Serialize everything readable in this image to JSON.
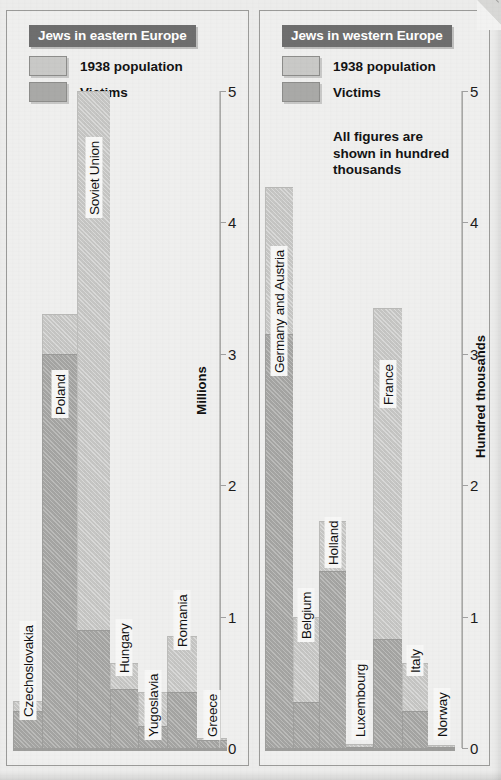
{
  "figure": {
    "note": "All figures are\nshown in hundred\nthousands"
  },
  "panels": {
    "east": {
      "title": "Jews in eastern Europe",
      "axis_title": "Millions",
      "legend": [
        {
          "key": "population",
          "label": "1938 population",
          "color": "#c9c9c7"
        },
        {
          "key": "victims",
          "label": "Victims",
          "color": "#a9a9a7"
        }
      ],
      "ticks": [
        "0",
        "1",
        "2",
        "3",
        "4",
        "5"
      ]
    },
    "west": {
      "title": "Jews in western Europe",
      "axis_title": "Hundred thousands",
      "legend": [
        {
          "key": "population",
          "label": "1938 population",
          "color": "#c9c9c7"
        },
        {
          "key": "victims",
          "label": "Victims",
          "color": "#a9a9a7"
        }
      ],
      "ticks": [
        "0",
        "1",
        "2",
        "3",
        "4",
        "5"
      ]
    }
  },
  "chart_data": [
    {
      "id": "eastern-europe",
      "type": "bar",
      "title": "Jews in eastern Europe",
      "xlabel": "",
      "ylabel": "Millions",
      "ylim": [
        0,
        5
      ],
      "yticks": [
        0,
        1,
        2,
        3,
        4,
        5
      ],
      "grid": false,
      "legend_position": "top-left",
      "note": "Stacked style: 1938 population bar with Victims bar overlaid in front",
      "categories": [
        "Czechoslovakia",
        "Poland",
        "Soviet Union",
        "Hungary",
        "Yugoslavia",
        "Romania",
        "Greece"
      ],
      "series": [
        {
          "name": "1938 population",
          "color": "#c9c9c7",
          "values": [
            0.36,
            3.3,
            5.0,
            0.65,
            0.43,
            0.85,
            0.08
          ]
        },
        {
          "name": "Victims",
          "color": "#a9a9a7",
          "values": [
            0.28,
            3.0,
            0.9,
            0.45,
            0.17,
            0.43,
            0.06
          ]
        }
      ]
    },
    {
      "id": "western-europe",
      "type": "bar",
      "title": "Jews in western Europe",
      "xlabel": "",
      "ylabel": "Hundred thousands",
      "ylim": [
        0,
        5
      ],
      "yticks": [
        0,
        1,
        2,
        3,
        4,
        5
      ],
      "grid": false,
      "legend_position": "top-left",
      "note": "All figures are shown in hundred thousands",
      "categories": [
        "Germany and Austria",
        "Belgium",
        "Holland",
        "Luxembourg",
        "France",
        "Italy",
        "Norway"
      ],
      "series": [
        {
          "name": "1938 population",
          "color": "#c9c9c7",
          "values": [
            4.27,
            1.0,
            1.73,
            0.03,
            3.35,
            0.65,
            0.02
          ]
        },
        {
          "name": "Victims",
          "color": "#a9a9a7",
          "values": [
            3.15,
            0.35,
            1.35,
            0.01,
            0.83,
            0.28,
            0.01
          ]
        }
      ]
    }
  ],
  "east_bars": [
    {
      "label": "Czechoslovakia",
      "pop": 0.36,
      "vic": 0.28,
      "width": 29,
      "label_bottom": 28
    },
    {
      "label": "Poland",
      "pop": 3.3,
      "vic": 3.0,
      "width": 35,
      "label_bottom": 330
    },
    {
      "label": "Soviet Union",
      "pop": 5.0,
      "vic": 0.9,
      "width": 33,
      "label_bottom": 530
    },
    {
      "label": "Hungary",
      "pop": 0.65,
      "vic": 0.45,
      "width": 28,
      "label_bottom": 72
    },
    {
      "label": "Yugoslavia",
      "pop": 0.43,
      "vic": 0.17,
      "width": 29,
      "label_bottom": 8
    },
    {
      "label": "Romania",
      "pop": 0.85,
      "vic": 0.43,
      "width": 30,
      "label_bottom": 98
    },
    {
      "label": "Greece",
      "pop": 0.08,
      "vic": 0.06,
      "width": 30,
      "label_bottom": 8
    }
  ],
  "west_bars": [
    {
      "label": "Germany and Austria",
      "pop": 4.27,
      "vic": 3.15,
      "width": 28,
      "label_bottom": 372
    },
    {
      "label": "Belgium",
      "pop": 1.0,
      "vic": 0.35,
      "width": 26,
      "label_bottom": 106
    },
    {
      "label": "Holland",
      "pop": 1.73,
      "vic": 1.35,
      "width": 27,
      "label_bottom": 180
    },
    {
      "label": "Luxembourg",
      "pop": 0.03,
      "vic": 0.01,
      "width": 27,
      "label_bottom": 8
    },
    {
      "label": "France",
      "pop": 3.35,
      "vic": 0.83,
      "width": 29,
      "label_bottom": 340
    },
    {
      "label": "Italy",
      "pop": 0.65,
      "vic": 0.28,
      "width": 26,
      "label_bottom": 72
    },
    {
      "label": "Norway",
      "pop": 0.02,
      "vic": 0.01,
      "width": 27,
      "label_bottom": 8
    }
  ]
}
